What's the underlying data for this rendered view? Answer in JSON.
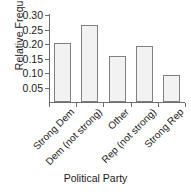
{
  "chart_data": {
    "type": "bar",
    "title": "",
    "xlabel": "Political Party",
    "ylabel": "Relative Frequency",
    "categories": [
      "Strong Dem",
      "Dem (not strong)",
      "Other",
      "Rep (not strong)",
      "Strong Rep"
    ],
    "values": [
      0.203,
      0.268,
      0.161,
      0.194,
      0.092
    ],
    "ylim": [
      0,
      0.305
    ],
    "yticks": [
      0.05,
      0.1,
      0.15,
      0.2,
      0.25,
      0.3
    ],
    "ytick_labels": [
      "0.05",
      "0.10",
      "0.15",
      "0.20",
      "0.25",
      "0.30"
    ],
    "grid": false,
    "legend": null,
    "bar_fill_color": "#f2f2f2",
    "bar_border_color": "#808080",
    "axis_color": "#6e6e6e",
    "background_color": "#ffffff",
    "xtick_label_rotation": 45
  }
}
